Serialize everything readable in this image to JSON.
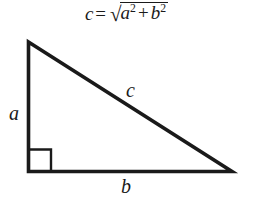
{
  "diagram": {
    "background_color": "#ffffff",
    "stroke_color": "#1a1a1a",
    "formula": {
      "lhs": "c",
      "equals": "=",
      "radical_symbol": "√",
      "term1_base": "a",
      "term1_exponent": "2",
      "plus": "+",
      "term2_base": "b",
      "term2_exponent": "2",
      "full_text": "c = √(a² + b²)"
    },
    "labels": {
      "leg_vertical": "a",
      "leg_horizontal": "b",
      "hypotenuse": "c"
    },
    "geometry": {
      "apex": "27,41",
      "bottom_left": "27,172",
      "bottom_right": "233,172",
      "right_angle_marker": "square at bottom-left vertex"
    }
  }
}
